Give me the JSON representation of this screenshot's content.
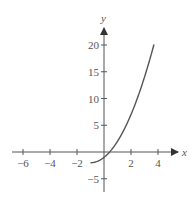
{
  "chart_data": {
    "type": "line",
    "title": "",
    "xlabel": "x",
    "ylabel": "y",
    "xlim": [
      -7,
      5
    ],
    "ylim": [
      -7,
      22
    ],
    "grid": false,
    "legend": null,
    "x_ticks": [
      -6,
      -4,
      -2,
      2,
      4
    ],
    "x_tick_labels": [
      "−6",
      "−4",
      "−2",
      "2",
      "4"
    ],
    "y_ticks": [
      20,
      15,
      10,
      5,
      -5
    ],
    "y_tick_labels": [
      "20",
      "15",
      "10",
      "5",
      "−5"
    ],
    "series": [
      {
        "name": "y = (x+1)^2 - 2, x ≥ -1",
        "x": [
          -1,
          -0.5,
          0,
          0.41,
          1,
          1.5,
          2,
          2.5,
          3,
          3.5,
          3.7
        ],
        "y": [
          -2,
          -1.75,
          -1,
          0,
          2,
          4.25,
          7,
          10.25,
          14,
          18.25,
          20.1
        ]
      }
    ],
    "colors": {
      "axis": "#555555",
      "curve": "#555555"
    }
  }
}
